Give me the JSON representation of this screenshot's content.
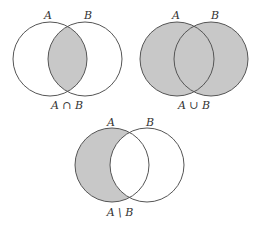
{
  "colors": {
    "fill": "#c8c8c8",
    "stroke": "#555555",
    "background": "#ffffff"
  },
  "diagrams": [
    {
      "name": "intersection",
      "set_a_label": "A",
      "set_b_label": "B",
      "caption": "A ∩ B",
      "shaded": "intersection"
    },
    {
      "name": "union",
      "set_a_label": "A",
      "set_b_label": "B",
      "caption": "A ∪ B",
      "shaded": "union"
    },
    {
      "name": "difference",
      "set_a_label": "A",
      "set_b_label": "B",
      "caption": "A \\ B",
      "shaded": "A minus B"
    }
  ]
}
